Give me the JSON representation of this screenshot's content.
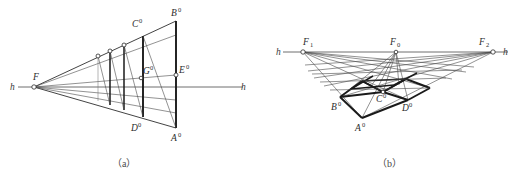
{
  "figure": {
    "kind": "geometric-perspective-construction",
    "width": 521,
    "height": 182,
    "background_color": "#ffffff",
    "line_color": "#1a1a1a",
    "horizon_color": "#6f6f6f"
  },
  "panel_a": {
    "caption": "（a）",
    "horizon_label_left": "h",
    "horizon_label_right": "h",
    "vanishing_point_label": "F",
    "points": {
      "B0_label": "B",
      "B0_sup": "0",
      "C0_label": "C",
      "C0_sup": "0",
      "G0_label": "G",
      "G0_sup": "0",
      "E0_label": "E",
      "E0_sup": "0",
      "D0_label": "D",
      "D0_sup": "0",
      "A0_label": "A",
      "A0_sup": "0"
    },
    "geometry": {
      "vanishing_point": [
        34,
        87
      ],
      "horizon_y": 87,
      "horizon_x_start": 10,
      "horizon_x_end": 248,
      "far_right_x": 176,
      "top_far": [
        176,
        21
      ],
      "bottom_far": [
        176,
        128
      ],
      "verticals_x": [
        98,
        110,
        124,
        143,
        176
      ],
      "eye_level_right": [
        176,
        75
      ]
    }
  },
  "panel_b": {
    "caption": "（b）",
    "horizon_label_left": "h",
    "horizon_label_right": "h",
    "points": {
      "F1_label": "F",
      "F1_sub": "1",
      "F0_label": "F",
      "F0_sub": "0",
      "F2_label": "F",
      "F2_sub": "2",
      "A0_label": "A",
      "A0_sup": "0",
      "B0_label": "B",
      "B0_sup": "0",
      "C0_label": "C",
      "C0_sup": "0",
      "D0_label": "D",
      "D0_sup": "0"
    },
    "geometry": {
      "horizon_y": 52,
      "horizon_x_start": 275,
      "horizon_x_end": 513,
      "F1": [
        303,
        52
      ],
      "F0": [
        396,
        52
      ],
      "F2": [
        493,
        52
      ],
      "A0": [
        362,
        118
      ],
      "B0": [
        340,
        97
      ],
      "C0": [
        383,
        92
      ],
      "D0": [
        408,
        100
      ]
    }
  }
}
